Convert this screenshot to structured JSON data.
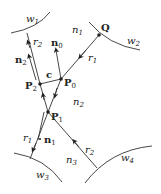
{
  "diagram": {
    "type": "ray-refraction-geometry",
    "regions": [
      {
        "id": "n1",
        "label": "n",
        "sub": "1"
      },
      {
        "id": "n2",
        "label": "n",
        "sub": "2"
      },
      {
        "id": "n3",
        "label": "n",
        "sub": "3"
      }
    ],
    "surfaces": [
      {
        "id": "w1",
        "label": "w",
        "sub": "1"
      },
      {
        "id": "w2",
        "label": "w",
        "sub": "2"
      },
      {
        "id": "w3",
        "label": "w",
        "sub": "3"
      },
      {
        "id": "w4",
        "label": "w",
        "sub": "4"
      }
    ],
    "points": [
      {
        "id": "Q",
        "label": "Q",
        "sub": ""
      },
      {
        "id": "P0",
        "label": "P",
        "sub": "0"
      },
      {
        "id": "P1",
        "label": "P",
        "sub": "1"
      },
      {
        "id": "P2",
        "label": "P",
        "sub": "2"
      }
    ],
    "normals": [
      {
        "id": "n0",
        "label": "n",
        "sub": "0"
      },
      {
        "id": "n1v",
        "label": "n",
        "sub": "1"
      },
      {
        "id": "n2v",
        "label": "n",
        "sub": "2"
      }
    ],
    "rays": [
      {
        "id": "r1_top",
        "label": "r",
        "sub": "1"
      },
      {
        "id": "r2_top",
        "label": "r",
        "sub": "2"
      },
      {
        "id": "r1_bottom",
        "label": "r",
        "sub": "1"
      },
      {
        "id": "r2_bottom",
        "label": "r",
        "sub": "2"
      }
    ],
    "segment": {
      "id": "c",
      "label": "c"
    }
  }
}
